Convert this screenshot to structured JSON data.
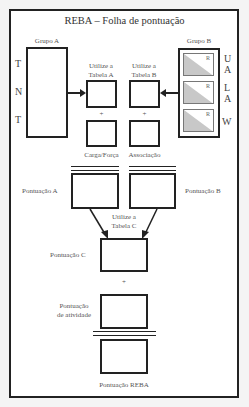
{
  "title": "REBA – Folha de pontuação",
  "group_a": {
    "label": "Grupo A",
    "letters": [
      "T",
      "N",
      "T"
    ]
  },
  "group_b": {
    "label": "Grupo B",
    "letters": [
      "U",
      "A",
      "L",
      "A",
      "W"
    ],
    "inner_label": "R",
    "triangle_color": "#c8c8c8"
  },
  "table_a": {
    "line1": "Utilize a",
    "line2": "Tabela A"
  },
  "table_b": {
    "line1": "Utilize a",
    "line2": "Tabela B"
  },
  "plus": "+",
  "load_force": "Carga/Força",
  "coupling": "Associação",
  "score_a": "Pontuação A",
  "score_b": "Pontuação B",
  "table_c": {
    "line1": "Utilize a",
    "line2": "Tabela C"
  },
  "score_c": "Pontuação C",
  "activity": {
    "line1": "Pontuação",
    "line2": "de atividade"
  },
  "reba_score": "Pontuação REBA"
}
